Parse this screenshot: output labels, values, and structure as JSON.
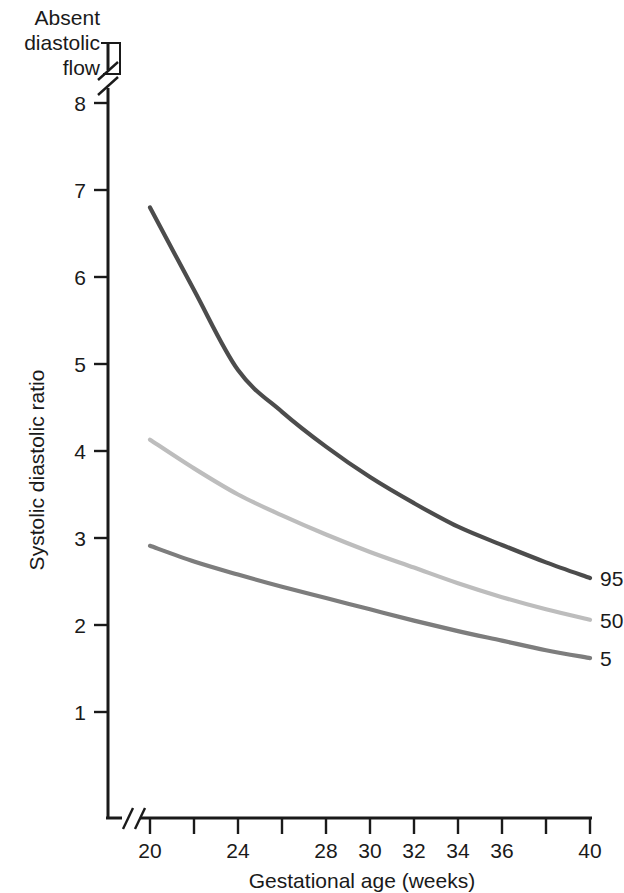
{
  "chart_data": {
    "type": "line",
    "title": "",
    "xlabel": "Gestational age (weeks)",
    "ylabel": "Systolic diastolic ratio",
    "xlim": [
      20,
      40
    ],
    "ylim": [
      0.55,
      8.45
    ],
    "grid": false,
    "legend_position": "right-end-of-line",
    "x_ticks": [
      20,
      22,
      24,
      26,
      28,
      30,
      32,
      34,
      36,
      38,
      40
    ],
    "x_tick_labels": [
      "20",
      "",
      "24",
      "",
      "28",
      "30",
      "32",
      "34",
      "36",
      "",
      "40"
    ],
    "y_ticks": [
      1,
      2,
      3,
      4,
      5,
      6,
      7,
      8
    ],
    "y_tick_labels": [
      "1",
      "2",
      "3",
      "4",
      "5",
      "6",
      "7",
      "8"
    ],
    "axis_breaks": {
      "y_axis_break_above": 8,
      "x_axis_break_below": 20
    },
    "annotations": [
      {
        "name": "absent-diastolic-flow",
        "lines": [
          "Absent",
          "diastolic",
          "flow"
        ],
        "text": "Absent diastolic flow",
        "points_to": "region above y-axis break"
      }
    ],
    "x": [
      20,
      22,
      24,
      26,
      28,
      30,
      32,
      34,
      36,
      38,
      40
    ],
    "series": [
      {
        "name": "95",
        "label": "95",
        "color": "#4c4c4c",
        "values": [
          6.8,
          5.85,
          4.93,
          4.45,
          4.05,
          3.7,
          3.4,
          3.13,
          2.92,
          2.72,
          2.54
        ]
      },
      {
        "name": "50",
        "label": "50",
        "color": "#bdbdbd",
        "values": [
          4.13,
          3.8,
          3.5,
          3.26,
          3.04,
          2.84,
          2.66,
          2.48,
          2.32,
          2.18,
          2.06
        ]
      },
      {
        "name": "5",
        "label": "5",
        "color": "#7d7d7d",
        "values": [
          2.91,
          2.73,
          2.58,
          2.44,
          2.31,
          2.18,
          2.05,
          1.93,
          1.82,
          1.71,
          1.62
        ]
      }
    ]
  },
  "axis": {
    "y_title": "Systolic diastolic ratio",
    "x_title": "Gestational age (weeks)"
  },
  "annotation": {
    "line1": "Absent",
    "line2": "diastolic",
    "line3": "flow"
  },
  "y_tick_labels": {
    "t8": "8",
    "t7": "7",
    "t6": "6",
    "t5": "5",
    "t4": "4",
    "t3": "3",
    "t2": "2",
    "t1": "1"
  },
  "x_tick_labels": {
    "t20": "20",
    "t24": "24",
    "t28": "28",
    "t30": "30",
    "t32": "32",
    "t34": "34",
    "t36": "36",
    "t40": "40"
  },
  "series_labels": {
    "p95": "95",
    "p50": "50",
    "p5": "5"
  },
  "colors": {
    "p95": "#4c4c4c",
    "p50": "#bdbdbd",
    "p5": "#7d7d7d",
    "axis": "#1a1a1a",
    "background": "#ffffff"
  }
}
